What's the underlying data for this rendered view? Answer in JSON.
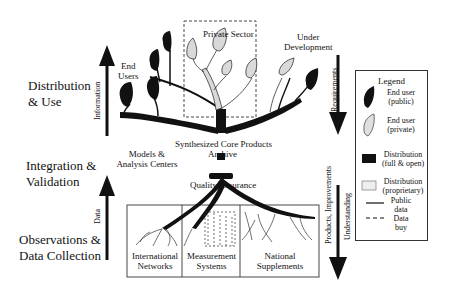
{
  "diagram": {
    "type": "tree-metaphor flow diagram",
    "stages": {
      "distribution": "Distribution\n& Use",
      "distribution_line1": "Distribution",
      "distribution_line2": "& Use",
      "integration_line1": "Integration &",
      "integration_line2": "Validation",
      "observations_line1": "Observations &",
      "observations_line2": "Data Collection"
    },
    "arrows": {
      "information": "Information",
      "data": "Data",
      "requirements": "Requirements",
      "products_improvements": "Products, Improvements",
      "understanding": "Understanding"
    },
    "nodes": {
      "end_users_line1": "End",
      "end_users_line2": "Users",
      "private_sector": "Private Sector",
      "under_development_line1": "Under",
      "under_development_line2": "Development",
      "models_line1": "Models &",
      "models_line2": "Analysis Centers",
      "archive_line1": "Synthesized Core Products",
      "archive_line2": "Archive",
      "quality_assurance": "Quality Assurance"
    },
    "roots": [
      {
        "line1": "International",
        "line2": "Networks"
      },
      {
        "line1": "Measurement",
        "line2": "Systems"
      },
      {
        "line1": "National",
        "line2": "Supplements"
      }
    ],
    "legend": {
      "title": "Legend",
      "items": [
        {
          "symbol": "black-leaf",
          "line1": "End user",
          "line2": "(public)"
        },
        {
          "symbol": "grey-leaf",
          "line1": "End user",
          "line2": "(private)"
        },
        {
          "symbol": "black-square",
          "line1": "Distribution",
          "line2": "(full & open)"
        },
        {
          "symbol": "grey-square",
          "line1": "Distribution",
          "line2": "(proprietary)"
        },
        {
          "symbol": "solid-line",
          "line1": "Public",
          "line2": "data"
        },
        {
          "symbol": "dashed-line",
          "line1": "Data",
          "line2": "buy"
        }
      ]
    },
    "colors": {
      "ink": "#111111",
      "private_fill": "#d9d9d9",
      "background": "#ffffff"
    }
  }
}
